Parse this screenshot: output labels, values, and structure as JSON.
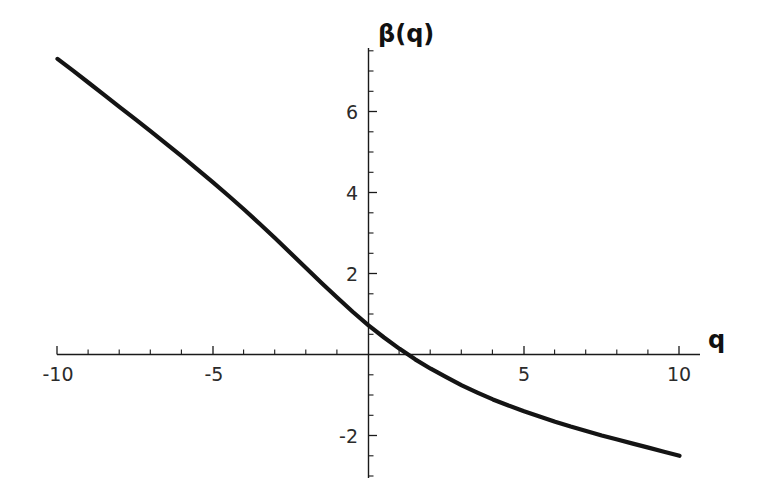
{
  "chart_data": {
    "type": "line",
    "title": "",
    "subtitle": "",
    "xlabel": "q",
    "ylabel": "β(q)",
    "xlim": [
      -10.4,
      11.2
    ],
    "ylim": [
      -3.0,
      7.6
    ],
    "grid": false,
    "legend": null,
    "x_ticks_major": [
      -10,
      -5,
      5,
      10
    ],
    "x_ticklabels": [
      "-10",
      "-5",
      "5",
      "10"
    ],
    "y_ticks_major": [
      2,
      4,
      6,
      -2
    ],
    "y_ticklabels": [
      "2",
      "4",
      "6",
      "-2"
    ],
    "x_tick_step_minor": 1,
    "y_tick_step_minor": 0.5,
    "series": [
      {
        "name": "β(q)",
        "color": "#141414",
        "x": [
          -10,
          -9.5,
          -9,
          -8.5,
          -8,
          -7.5,
          -7,
          -6.5,
          -6,
          -5.5,
          -5,
          -4.5,
          -4,
          -3.5,
          -3,
          -2.5,
          -2,
          -1.5,
          -1,
          -0.5,
          0,
          0.5,
          1,
          1.5,
          2,
          2.5,
          3,
          3.5,
          4,
          4.5,
          5,
          5.5,
          6,
          6.5,
          7,
          7.5,
          8,
          8.5,
          9,
          9.5,
          10
        ],
        "y": [
          7.3,
          7.01,
          6.71,
          6.41,
          6.11,
          5.81,
          5.51,
          5.2,
          4.89,
          4.57,
          4.25,
          3.92,
          3.58,
          3.23,
          2.87,
          2.5,
          2.13,
          1.76,
          1.4,
          1.05,
          0.72,
          0.42,
          0.14,
          -0.12,
          -0.35,
          -0.56,
          -0.76,
          -0.94,
          -1.11,
          -1.26,
          -1.4,
          -1.53,
          -1.66,
          -1.78,
          -1.89,
          -2.0,
          -2.1,
          -2.2,
          -2.3,
          -2.4,
          -2.5
        ]
      }
    ],
    "annotations": [],
    "axis_color": "#1a1a1a",
    "background_color": "#ffffff",
    "zero_crossing_q": 1.25
  },
  "axes": {
    "y_axis_title": "β(q)",
    "x_axis_title": "q"
  }
}
